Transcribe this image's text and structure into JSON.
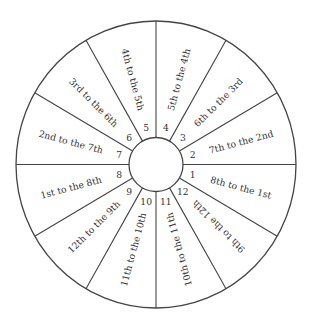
{
  "diagram": {
    "type": "house-wheel",
    "center": [
      156,
      164.5
    ],
    "outer_radius": [
      140,
      143.5
    ],
    "inner_radius": 27,
    "label_radius": 88,
    "number_radius": 38,
    "line_color": "#444444",
    "text_color": "#333333",
    "sectors": [
      {
        "number": "1",
        "label": "8th to the 1st"
      },
      {
        "number": "2",
        "label": "7th to the 2nd"
      },
      {
        "number": "3",
        "label": "6th to the 3rd"
      },
      {
        "number": "4",
        "label": "5th to the 4th"
      },
      {
        "number": "5",
        "label": "4th to the 5th"
      },
      {
        "number": "6",
        "label": "3rd to the 6th"
      },
      {
        "number": "7",
        "label": "2nd to the 7th"
      },
      {
        "number": "8",
        "label": "1st to the 8th"
      },
      {
        "number": "9",
        "label": "12th to the 9th"
      },
      {
        "number": "10",
        "label": "11th to the 10th"
      },
      {
        "number": "11",
        "label": "10th to the 11th"
      },
      {
        "number": "12",
        "label": "9th to the 12th"
      }
    ]
  }
}
